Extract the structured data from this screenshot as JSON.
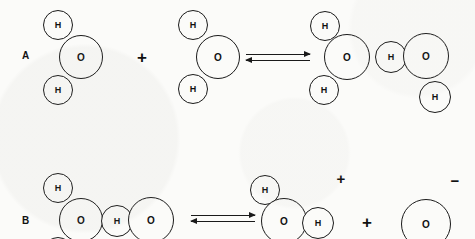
{
  "figure": {
    "background_color": "#fbfbf9",
    "stroke_color": "#1a1a1a",
    "symbols": {
      "plus": "+",
      "minus": "−",
      "oxygen_label": "O",
      "hydrogen_label": "H"
    }
  },
  "rows": [
    {
      "label": "A",
      "label_x": 22,
      "label_y": 50,
      "equation_text": "H2O + H2O ⇌ H3O+ + OH-",
      "arrow": {
        "x": 246,
        "y": 54,
        "width": 64
      },
      "operators": [
        {
          "kind": "plus",
          "symbol": "+",
          "x": 142,
          "y": 57
        }
      ],
      "charges": [],
      "species": [
        {
          "name": "water-molecule-left",
          "formula": "H2O",
          "atoms": [
            {
              "element": "H",
              "label": "H",
              "cx": 58,
              "cy": 25,
              "r": 15
            },
            {
              "element": "H",
              "label": "H",
              "cx": 58,
              "cy": 90,
              "r": 15
            },
            {
              "element": "O",
              "label": "O",
              "cx": 81,
              "cy": 57,
              "r": 22
            }
          ]
        },
        {
          "name": "water-molecule-right",
          "formula": "H2O",
          "atoms": [
            {
              "element": "H",
              "label": "H",
              "cx": 193,
              "cy": 25,
              "r": 15
            },
            {
              "element": "H",
              "label": "H",
              "cx": 193,
              "cy": 89,
              "r": 15
            },
            {
              "element": "O",
              "label": "O",
              "cx": 218,
              "cy": 57,
              "r": 22
            }
          ]
        },
        {
          "name": "hydronium-hydroxide-complex",
          "formula": "H3O+ OH-",
          "atoms": [
            {
              "element": "H",
              "label": "H",
              "cx": 325,
              "cy": 26,
              "r": 15
            },
            {
              "element": "H",
              "label": "H",
              "cx": 324,
              "cy": 90,
              "r": 15
            },
            {
              "element": "O",
              "label": "O",
              "cx": 347,
              "cy": 57,
              "r": 23
            },
            {
              "element": "H",
              "label": "H",
              "cx": 391,
              "cy": 57,
              "r": 16
            },
            {
              "element": "O",
              "label": "O",
              "cx": 426,
              "cy": 56,
              "r": 23
            },
            {
              "element": "H",
              "label": "H",
              "cx": 435,
              "cy": 97,
              "r": 16
            }
          ]
        }
      ]
    },
    {
      "label": "B",
      "label_x": 22,
      "label_y": 215,
      "equation_text": "H2O-H-OH2 ⇌ H3O+ + OH-",
      "arrow": {
        "x": 191,
        "y": 215,
        "width": 64
      },
      "operators": [
        {
          "kind": "plus",
          "symbol": "+",
          "x": 367,
          "y": 222
        }
      ],
      "charges": [
        {
          "symbol": "+",
          "x": 341,
          "y": 178
        },
        {
          "symbol": "−",
          "x": 455,
          "y": 180
        }
      ],
      "species": [
        {
          "name": "water-dimer-complex",
          "formula": "H2O-H-OH2",
          "atoms": [
            {
              "element": "H",
              "label": "H",
              "cx": 58,
              "cy": 188,
              "r": 15
            },
            {
              "element": "H",
              "label": "H",
              "cx": 58,
              "cy": 252,
              "r": 15
            },
            {
              "element": "O",
              "label": "O",
              "cx": 81,
              "cy": 220,
              "r": 22
            },
            {
              "element": "H",
              "label": "H",
              "cx": 117,
              "cy": 221,
              "r": 16
            },
            {
              "element": "O",
              "label": "O",
              "cx": 151,
              "cy": 220,
              "r": 23
            }
          ]
        },
        {
          "name": "hydronium-ion",
          "formula": "H3O+",
          "atoms": [
            {
              "element": "H",
              "label": "H",
              "cx": 265,
              "cy": 190,
              "r": 15
            },
            {
              "element": "O",
              "label": "O",
              "cx": 284,
              "cy": 221,
              "r": 23
            },
            {
              "element": "H",
              "label": "H",
              "cx": 318,
              "cy": 223,
              "r": 16
            }
          ]
        },
        {
          "name": "hydroxide-ion",
          "formula": "OH-",
          "atoms": [
            {
              "element": "O",
              "label": "O",
              "cx": 426,
              "cy": 224,
              "r": 25
            }
          ]
        }
      ]
    }
  ]
}
